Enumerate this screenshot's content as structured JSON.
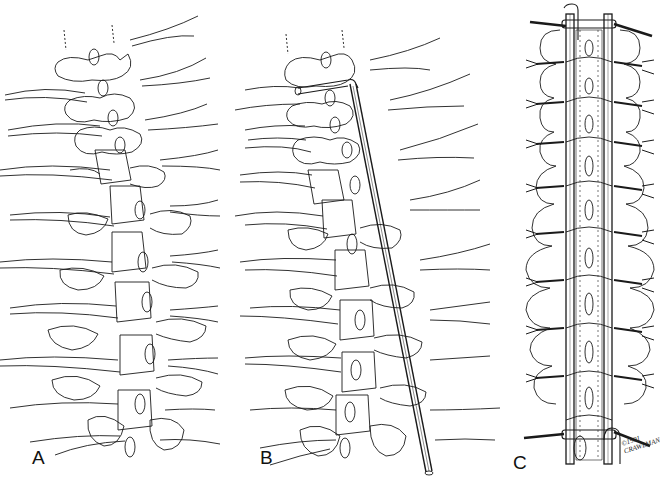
{
  "figure": {
    "panels": [
      {
        "id": "A",
        "label": "A",
        "description": "Posterior view of scoliotic spine with sublaminar wires passed at each level"
      },
      {
        "id": "B",
        "label": "B",
        "description": "Rod contoured and placed along concave side, wires beginning to be tightened"
      },
      {
        "id": "C",
        "label": "C",
        "description": "Bilateral rods secured with twisted sublaminar wires at each level, transverse bars at ends"
      }
    ],
    "signature": {
      "line1": "©1991",
      "line2": "CRAWLMAN"
    },
    "colors": {
      "ink": "#1a1a1a",
      "background": "#ffffff"
    }
  }
}
